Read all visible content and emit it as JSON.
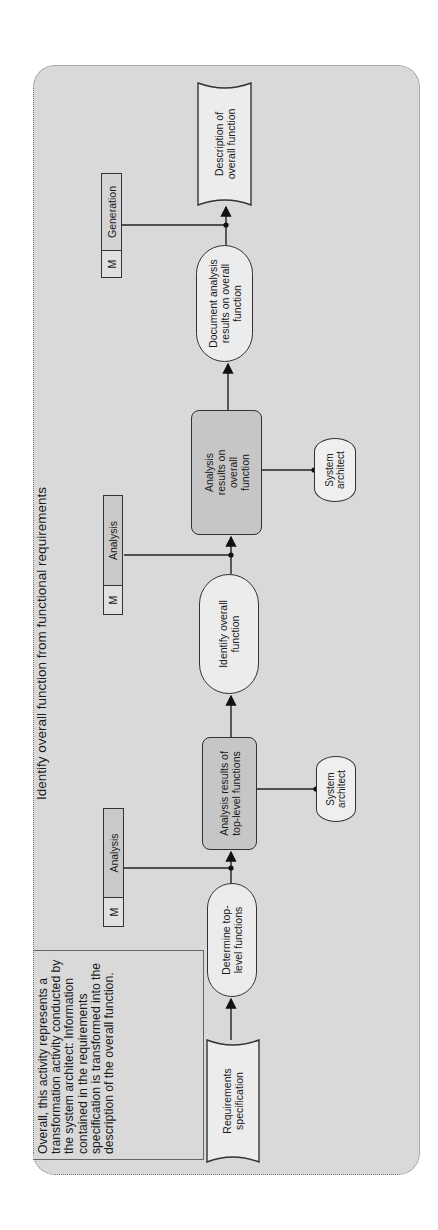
{
  "diagram": {
    "title": "Identify overall function from functional requirements",
    "note": "Overall, this activity represents a transformation activity conducted by the system architect: Information contained in the requirements specification is transformed into the description of the overall function.",
    "orientation": "rotated 90° counter-clockwise",
    "colors": {
      "background": "#d9d9d9",
      "shaded_box": "#c6c6c6",
      "light_shape": "#ececec",
      "stroke": "#333333"
    },
    "flow": [
      {
        "id": "req_spec",
        "type": "document",
        "label": "Requirements specification"
      },
      {
        "id": "determine",
        "type": "activity",
        "label": "Determine top-level functions"
      },
      {
        "id": "analysis_top",
        "type": "information-shaded",
        "label": "Analysis results of top-level functions"
      },
      {
        "id": "identify",
        "type": "activity",
        "label": "Identify overall function"
      },
      {
        "id": "analysis_overall",
        "type": "information-shaded",
        "label": "Analysis results on overall function"
      },
      {
        "id": "document",
        "type": "activity",
        "label": "Document analysis results on overall function"
      },
      {
        "id": "description",
        "type": "document",
        "label": "Description of overall function"
      }
    ],
    "methods": [
      {
        "marker": "M",
        "label": "Analysis",
        "attached_to": "determine → analysis_top"
      },
      {
        "marker": "M",
        "label": "Analysis",
        "attached_to": "identify → analysis_overall"
      },
      {
        "marker": "M",
        "label": "Generation",
        "attached_to": "document → description"
      }
    ],
    "roles": [
      {
        "label": "System architect",
        "attached_to": "analysis_top"
      },
      {
        "label": "System architect",
        "attached_to": "analysis_overall"
      }
    ]
  }
}
